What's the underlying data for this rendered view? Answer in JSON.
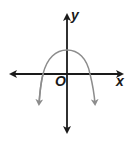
{
  "diagram": {
    "type": "coordinate-graph",
    "labels": {
      "y_axis": "y",
      "x_axis": "x",
      "origin": "O"
    },
    "colors": {
      "axes": "#1a1a1a",
      "curve": "#8c8c8c"
    },
    "curve": {
      "shape": "parabola",
      "opens": "down",
      "vertex_position": "on positive y-axis",
      "x_intercepts": 2
    }
  }
}
